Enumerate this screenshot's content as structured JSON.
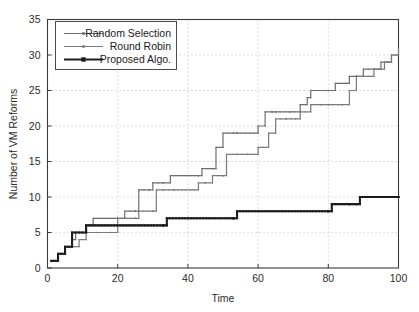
{
  "chart_data": {
    "type": "line",
    "title": "",
    "xlabel": "Time",
    "ylabel": "Number of VM Reforms",
    "xlim": [
      0,
      100
    ],
    "ylim": [
      0,
      35
    ],
    "xticks": [
      0,
      20,
      40,
      60,
      80,
      100
    ],
    "yticks": [
      0,
      5,
      10,
      15,
      20,
      25,
      30,
      35
    ],
    "xtick_labels": [
      "0",
      "20",
      "40",
      "60",
      "80",
      "100"
    ],
    "ytick_labels": [
      "0",
      "5",
      "10",
      "15",
      "20",
      "25",
      "30",
      "35"
    ],
    "grid": true,
    "drawstyle": "steps-post",
    "legend_position": "upper-left",
    "series": [
      {
        "name": "Random Selection",
        "color": "#6e6e6e",
        "linewidth": 1.2,
        "marker": "dot",
        "x": [
          1,
          3,
          5,
          7,
          8,
          11,
          13,
          20,
          22,
          25,
          26,
          29,
          30,
          33,
          35,
          43,
          44,
          47,
          48,
          50,
          53,
          54,
          60,
          62,
          64,
          65,
          69,
          72,
          74,
          75,
          80,
          82,
          85,
          86,
          88,
          90,
          93,
          95,
          97,
          98,
          100
        ],
        "y": [
          1,
          2,
          3,
          4,
          5,
          6,
          7,
          7,
          8,
          8,
          11,
          11,
          12,
          12,
          13,
          13,
          14,
          14,
          17,
          19,
          19,
          19,
          20,
          22,
          22,
          22,
          22,
          23,
          24,
          25,
          25,
          26,
          26,
          27,
          27,
          28,
          28,
          29,
          29,
          30,
          30
        ]
      },
      {
        "name": "Round Robin",
        "color": "#7a7a7a",
        "linewidth": 1.2,
        "marker": "dot",
        "x": [
          1,
          3,
          5,
          7,
          9,
          11,
          14,
          18,
          20,
          25,
          26,
          30,
          31,
          33,
          36,
          43,
          45,
          47,
          50,
          51,
          54,
          57,
          60,
          63,
          65,
          68,
          72,
          75,
          78,
          80,
          84,
          86,
          88,
          90,
          93,
          96,
          98,
          100
        ],
        "y": [
          1,
          2,
          3,
          3,
          4,
          5,
          5,
          5,
          7,
          7,
          8,
          8,
          11,
          11,
          11,
          12,
          12,
          13,
          13,
          16,
          16,
          16,
          17,
          19,
          21,
          21,
          22,
          23,
          23,
          23,
          23,
          25,
          27,
          27,
          28,
          29,
          30,
          31
        ]
      },
      {
        "name": "Proposed Algo.",
        "color": "#1c1c1c",
        "linewidth": 2.1,
        "marker": "square",
        "x": [
          1,
          3,
          5,
          7,
          11,
          33,
          34,
          53,
          54,
          80,
          81,
          86,
          88,
          89,
          100
        ],
        "y": [
          1,
          2,
          3,
          5,
          6,
          6,
          7,
          7,
          8,
          8,
          9,
          9,
          9,
          10,
          10
        ]
      }
    ]
  },
  "legend": {
    "items": [
      {
        "label": "Random Selection"
      },
      {
        "label": "Round Robin"
      },
      {
        "label": "Proposed Algo."
      }
    ]
  }
}
